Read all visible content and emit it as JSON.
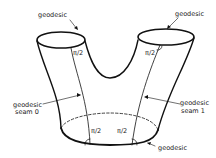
{
  "figure": {
    "labels": {
      "geodesic_top_left": "geodesic",
      "geodesic_top_right": "geodesic",
      "geodesic_bottom": "geodesic",
      "seam0_line1": "geodesic",
      "seam0_line2": "seam 0",
      "seam1_line1": "geodesic",
      "seam1_line2": "seam 1",
      "angle_top_left": "π/2",
      "angle_top_right": "π/2",
      "angle_bottom_left": "π/2",
      "angle_bottom_right": "π/2"
    },
    "colors": {
      "line": "#111111",
      "background": "#ffffff"
    }
  }
}
